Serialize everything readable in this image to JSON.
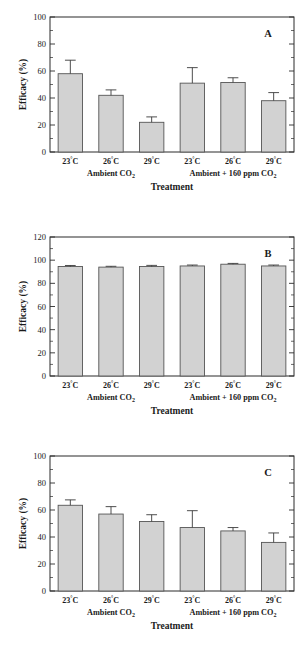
{
  "figure": {
    "bar_fill_color": "#d2d2d2",
    "bar_stroke_color": "#555555",
    "axis_color": "#2b2b2b",
    "background_color": "#ffffff"
  },
  "chart_data": [
    {
      "type": "bar",
      "panel": "A",
      "title": "",
      "xlabel": "Treatment",
      "ylabel": "Efficacy (%)",
      "ylim": [
        0,
        100
      ],
      "yticks": [
        0,
        20,
        40,
        60,
        80,
        100
      ],
      "ytick_labels": [
        "0",
        "20",
        "40",
        "60",
        "80",
        "100"
      ],
      "grid": false,
      "legend": "none",
      "categories": [
        "23°C",
        "26°C",
        "29°C",
        "23°C",
        "26°C",
        "29°C"
      ],
      "groups": [
        {
          "label": "Ambient CO",
          "subscript": "2",
          "members": [
            0,
            1,
            2
          ]
        },
        {
          "label": "Ambient + 160 ppm CO",
          "subscript": "2",
          "members": [
            3,
            4,
            5
          ]
        }
      ],
      "values": [
        58,
        42,
        22,
        51,
        51.5,
        38
      ],
      "errors": [
        10,
        4,
        4,
        11.5,
        3.5,
        6
      ]
    },
    {
      "type": "bar",
      "panel": "B",
      "title": "",
      "xlabel": "Treatment",
      "ylabel": "Efficacy (%)",
      "ylim": [
        0,
        120
      ],
      "yticks": [
        0,
        20,
        40,
        60,
        80,
        100,
        120
      ],
      "ytick_labels": [
        "0",
        "20",
        "40",
        "60",
        "80",
        "100",
        "120"
      ],
      "grid": false,
      "legend": "none",
      "categories": [
        "23°C",
        "26°C",
        "29°C",
        "23°C",
        "26°C",
        "29°C"
      ],
      "groups": [
        {
          "label": "Ambient CO",
          "subscript": "2",
          "members": [
            0,
            1,
            2
          ]
        },
        {
          "label": "Ambient + 160 ppm CO",
          "subscript": "2",
          "members": [
            3,
            4,
            5
          ]
        }
      ],
      "values": [
        94.5,
        94,
        94.5,
        95,
        96.5,
        95
      ],
      "errors": [
        0.9,
        0.7,
        1.0,
        0.8,
        0.7,
        0.8
      ]
    },
    {
      "type": "bar",
      "panel": "C",
      "title": "",
      "xlabel": "Treatment",
      "ylabel": "Efficacy (%)",
      "ylim": [
        0,
        100
      ],
      "yticks": [
        0,
        20,
        40,
        60,
        80,
        100
      ],
      "ytick_labels": [
        "0",
        "20",
        "40",
        "60",
        "80",
        "100"
      ],
      "grid": false,
      "legend": "none",
      "categories": [
        "23°C",
        "26°C",
        "29°C",
        "23°C",
        "26°C",
        "29°C"
      ],
      "groups": [
        {
          "label": "Ambient CO",
          "subscript": "2",
          "members": [
            0,
            1,
            2
          ]
        },
        {
          "label": "Ambient + 160 ppm CO",
          "subscript": "2",
          "members": [
            3,
            4,
            5
          ]
        }
      ],
      "values": [
        63.5,
        57,
        51.5,
        47,
        44.5,
        36
      ],
      "errors": [
        4,
        5.5,
        5,
        12.5,
        2.5,
        7
      ]
    }
  ]
}
